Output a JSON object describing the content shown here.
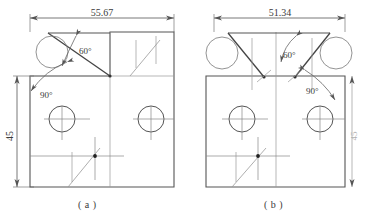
{
  "figure": {
    "type": "engineering-drawing",
    "background_color": "#ffffff",
    "line_color": "#555555",
    "text_color": "#3a3a3a",
    "panels": [
      {
        "id": "a",
        "caption": "( a )",
        "dimensions": {
          "width_label": "55.67",
          "height_label": "45"
        },
        "angles": [
          {
            "label": "60°",
            "location": "top-left-notch"
          },
          {
            "label": "90°",
            "location": "left-upper-corner"
          }
        ],
        "features": {
          "circles": 2,
          "notch": "triangular-cut-top-left",
          "center_mark": true
        }
      },
      {
        "id": "b",
        "caption": "( b )",
        "dimensions": {
          "width_label": "51.34",
          "height_label": "45"
        },
        "angles": [
          {
            "label": "60°",
            "location": "top-center"
          },
          {
            "label": "90°",
            "location": "right-upper-corner"
          }
        ],
        "features": {
          "circles": 2,
          "notch": "trapezoidal-cut-top",
          "center_mark": true
        }
      }
    ]
  }
}
